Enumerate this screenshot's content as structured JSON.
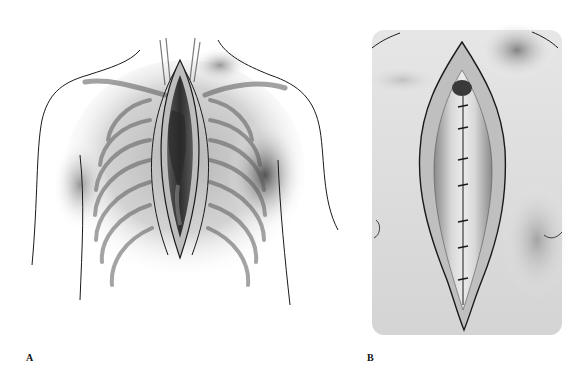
{
  "figure": {
    "panels": [
      {
        "id": "A",
        "label": "A",
        "description": "Anterior chest with rib cage and open median sternotomy exposing heart"
      },
      {
        "id": "B",
        "label": "B",
        "description": "Close-up of sternotomy incision with sternal wire closure"
      }
    ]
  },
  "colors": {
    "background": "#ffffff",
    "line": "#1a1a1a",
    "shadow": "#6e6e6e",
    "tissue": "#9a9a9a",
    "dark_cavity": "#3a3a3a"
  }
}
